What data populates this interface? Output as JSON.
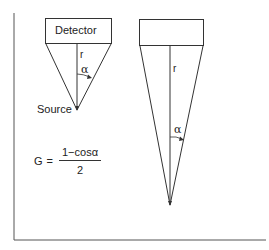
{
  "diagram": {
    "left_geometry": {
      "detector_label": "Detector",
      "radius_label": "r",
      "angle_label": "α",
      "source_label": "Source"
    },
    "right_geometry": {
      "detector_label": "",
      "radius_label": "r",
      "angle_label": "α"
    },
    "formula": {
      "lhs": "G",
      "equals": "=",
      "numerator": "1−cosα",
      "denominator": "2"
    },
    "colors": {
      "line": "#333333",
      "background": "#ffffff"
    }
  }
}
